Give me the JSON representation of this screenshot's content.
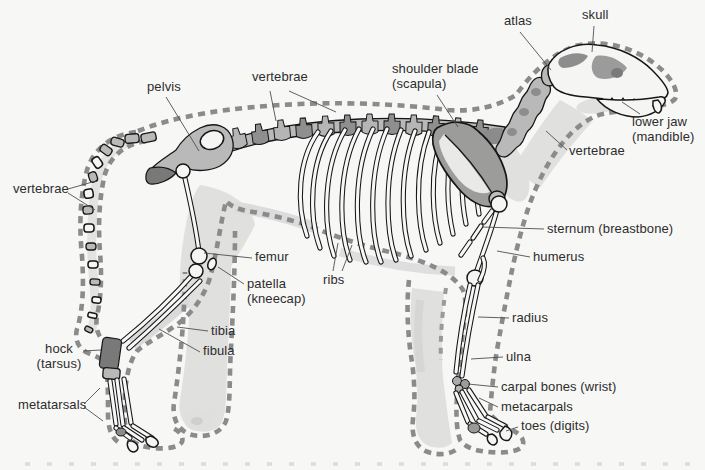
{
  "colors": {
    "background": "#f7f7f5",
    "outline_dash_gray": "#8b8b8b",
    "bone_outline": "#161616",
    "bone_fill": "#f5f5f4",
    "bone_gray": "#b9b9b9",
    "dark_gray": "#797979",
    "soft_shading": "#e0e0df",
    "label_text": "#2d2d2d",
    "leader_line": "#4f4f4f"
  },
  "labels": {
    "vertebrae_tail": {
      "lines": [
        "vertebrae"
      ]
    },
    "pelvis": {
      "lines": [
        "pelvis"
      ]
    },
    "vertebrae_back": {
      "lines": [
        "vertebrae"
      ]
    },
    "shoulder_blade": {
      "lines": [
        "shoulder blade",
        "(scapula)"
      ]
    },
    "atlas": {
      "lines": [
        "atlas"
      ]
    },
    "skull": {
      "lines": [
        "skull"
      ]
    },
    "lower_jaw": {
      "lines": [
        "lower jaw",
        "(mandible)"
      ]
    },
    "vertebrae_neck": {
      "lines": [
        "vertebrae"
      ]
    },
    "sternum": {
      "lines": [
        "sternum (breastbone)"
      ]
    },
    "humerus": {
      "lines": [
        "humerus"
      ]
    },
    "ribs": {
      "lines": [
        "ribs"
      ]
    },
    "femur": {
      "lines": [
        "femur"
      ]
    },
    "patella": {
      "lines": [
        "patella",
        "(kneecap)"
      ]
    },
    "tibia": {
      "lines": [
        "tibia"
      ]
    },
    "fibula": {
      "lines": [
        "fibula"
      ]
    },
    "hock": {
      "lines": [
        "hock",
        "(tarsus)"
      ]
    },
    "metatarsals": {
      "lines": [
        "metatarsals"
      ]
    },
    "radius": {
      "lines": [
        "radius"
      ]
    },
    "ulna": {
      "lines": [
        "ulna"
      ]
    },
    "carpal_bones": {
      "lines": [
        "carpal bones (wrist)"
      ]
    },
    "metacarpals": {
      "lines": [
        "metacarpals"
      ]
    },
    "toes": {
      "lines": [
        "toes (digits)"
      ]
    }
  }
}
